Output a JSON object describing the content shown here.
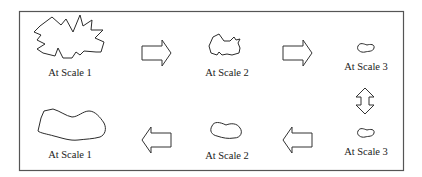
{
  "diagram": {
    "type": "scale-transformation-cycle",
    "colors": {
      "stroke": "#2b2b2b",
      "frame": "#555555",
      "background": "#ffffff"
    },
    "top_row": {
      "items": [
        {
          "label": "At Scale 1",
          "shape": "jagged-star-polygon"
        },
        {
          "label": "At Scale 2",
          "shape": "partially-smoothed-polygon"
        },
        {
          "label": "At Scale 3",
          "shape": "small-smooth-blob"
        }
      ],
      "arrows": [
        "right-arrow",
        "right-arrow"
      ]
    },
    "connector": {
      "type": "double-vertical-arrow"
    },
    "bottom_row": {
      "items": [
        {
          "label": "At Scale 1",
          "shape": "large-smooth-blob"
        },
        {
          "label": "At Scale 2",
          "shape": "medium-smooth-blob"
        },
        {
          "label": "At Scale 3",
          "shape": "small-smooth-blob"
        }
      ],
      "arrows": [
        "left-arrow",
        "left-arrow"
      ]
    }
  }
}
